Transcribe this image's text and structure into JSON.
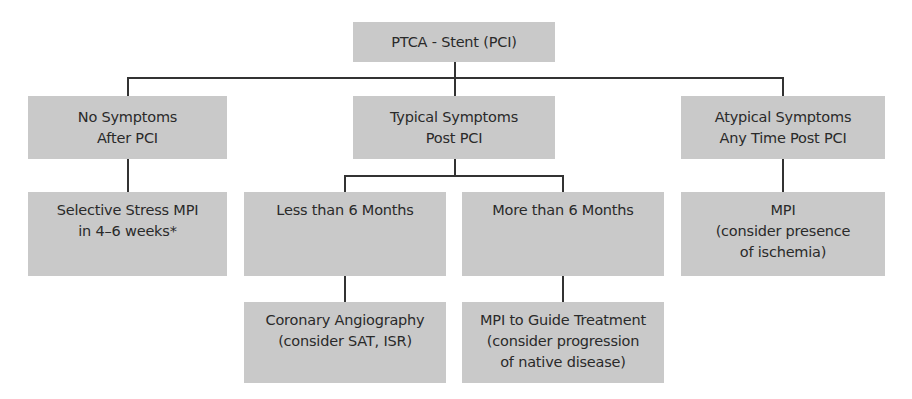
{
  "diagram": {
    "type": "flowchart",
    "root": {
      "label": "PTCA - Stent (PCI)"
    },
    "branches": [
      {
        "lines": [
          "No Symptoms",
          "After PCI"
        ],
        "children": [
          {
            "lines": [
              "Selective Stress MPI",
              "in 4–6 weeks*"
            ]
          }
        ]
      },
      {
        "lines": [
          "Typical Symptoms",
          "Post PCI"
        ],
        "children": [
          {
            "lines": [
              "Less than 6 Months"
            ],
            "children": [
              {
                "lines": [
                  "Coronary Angiography",
                  "(consider SAT, ISR)"
                ]
              }
            ]
          },
          {
            "lines": [
              "More than 6 Months"
            ],
            "children": [
              {
                "lines": [
                  "MPI to Guide Treatment",
                  "(consider progression",
                  "of native disease)"
                ]
              }
            ]
          }
        ]
      },
      {
        "lines": [
          "Atypical Symptoms",
          "Any Time Post PCI"
        ],
        "children": [
          {
            "lines": [
              "MPI",
              "(consider presence",
              "of ischemia)"
            ]
          }
        ]
      }
    ]
  },
  "colors": {
    "box_fill": "#c9c9c9",
    "text": "#2a2a2a",
    "connector": "#333333",
    "background": "#ffffff"
  }
}
